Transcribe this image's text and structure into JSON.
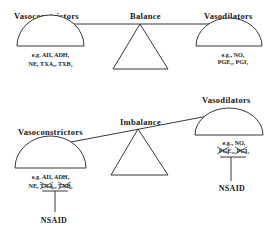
{
  "top_scale": {
    "state_label": "Balance",
    "left": {
      "title": "Vasoconstrictors",
      "line1": "e.g. AII, ADH,",
      "line2_prefix": "NE, ",
      "items": [
        "TXA₂",
        "TXB₂"
      ]
    },
    "right": {
      "title": "Vasodilators",
      "line1": "e.g., NO,",
      "items": [
        "PGE₂",
        "PGI₂"
      ]
    }
  },
  "bottom_scale": {
    "state_label": "Imbalance",
    "left": {
      "title": "Vasoconstrictors",
      "line1": "e.g. AII, ADH,",
      "line2_prefix": "NE, ",
      "items": [
        "TXA₂",
        "TXB₂"
      ],
      "blocked": true,
      "blocker": "NSAID"
    },
    "right": {
      "title": "Vasodilators",
      "line1": "e.g., NO,",
      "items": [
        "PGE₂",
        "PGI₂"
      ],
      "blocked": true,
      "blocker": "NSAID"
    }
  }
}
